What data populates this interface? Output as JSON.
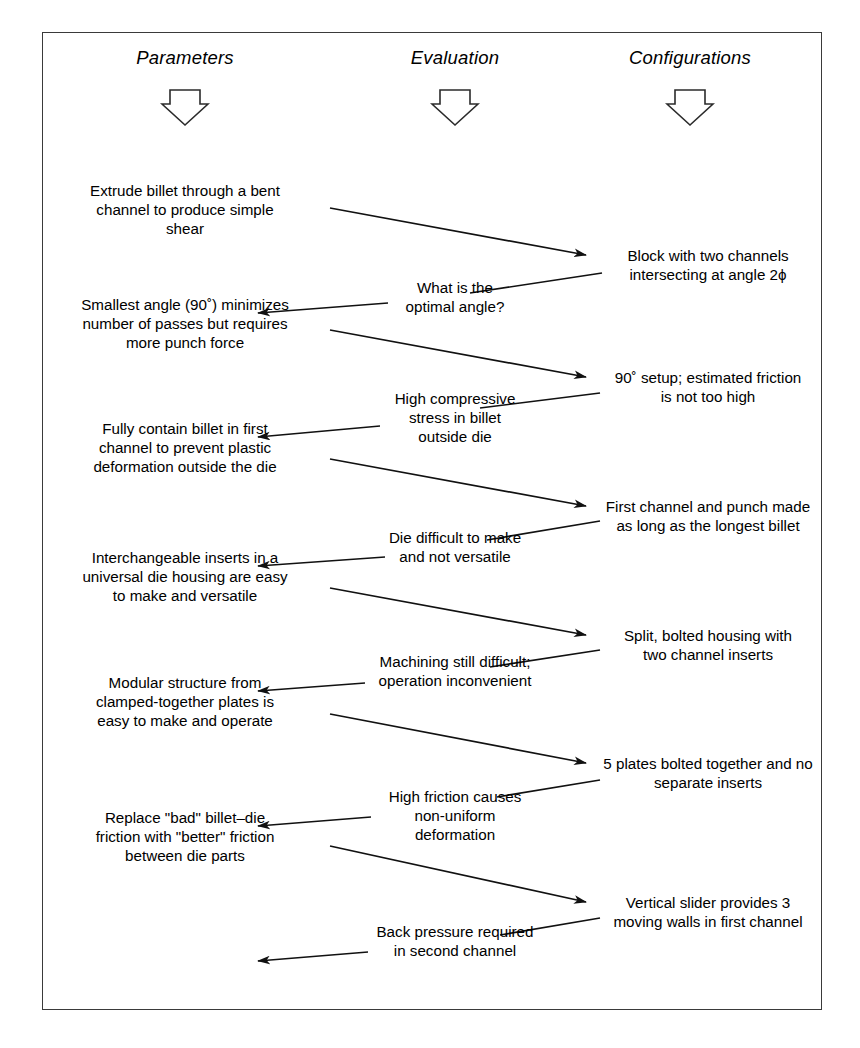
{
  "diagram": {
    "frame": {
      "border_color": "#3a3a3a",
      "background": "#ffffff"
    },
    "columns": [
      {
        "id": "parameters",
        "label": "Parameters",
        "arrow_icon": "block-down-arrow-icon"
      },
      {
        "id": "evaluation",
        "label": "Evaluation",
        "arrow_icon": "block-down-arrow-icon"
      },
      {
        "id": "configurations",
        "label": "Configurations",
        "arrow_icon": "block-down-arrow-icon"
      }
    ],
    "parameters": [
      {
        "id": "p1",
        "text": "Extrude billet through a bent\nchannel to produce simple\nshear"
      },
      {
        "id": "p2",
        "text": "Smallest angle (90˚) minimizes\nnumber of passes but requires\nmore punch force"
      },
      {
        "id": "p3",
        "text": "Fully contain billet in first\nchannel to prevent plastic\ndeformation outside the die"
      },
      {
        "id": "p4",
        "text": "Interchangeable inserts in a\nuniversal die housing are easy\nto make and versatile"
      },
      {
        "id": "p5",
        "text": "Modular structure from\nclamped-together plates is\neasy to make and operate"
      },
      {
        "id": "p6",
        "text": "Replace \"bad\"  billet–die\nfriction with \"better\" friction\nbetween die parts"
      }
    ],
    "evaluations": [
      {
        "id": "e1",
        "text": "What is the\noptimal angle?"
      },
      {
        "id": "e2",
        "text": "High compressive\nstress in billet\noutside die"
      },
      {
        "id": "e3",
        "text": "Die difficult to make\nand not versatile"
      },
      {
        "id": "e4",
        "text": "Machining still difficult;\noperation inconvenient"
      },
      {
        "id": "e5",
        "text": "High friction causes\nnon-uniform\ndeformation"
      },
      {
        "id": "e6",
        "text": "Back pressure required\nin second channel"
      }
    ],
    "configurations": [
      {
        "id": "c1",
        "text": "Block with two channels\nintersecting at angle 2ϕ"
      },
      {
        "id": "c2",
        "text": "90˚ setup; estimated friction\nis not too high"
      },
      {
        "id": "c3",
        "text": "First channel and punch made\nas long as the longest billet"
      },
      {
        "id": "c4",
        "text": "Split, bolted housing with\ntwo channel inserts"
      },
      {
        "id": "c5",
        "text": "5 plates bolted together and no\nseparate inserts"
      },
      {
        "id": "c6",
        "text": "Vertical slider provides 3\nmoving walls in first channel"
      }
    ],
    "connectors": [
      {
        "id": "a1",
        "from": "p1",
        "to": "c1",
        "direction": "right"
      },
      {
        "id": "a2",
        "from": "c1",
        "to": "p2",
        "direction": "left"
      },
      {
        "id": "a3",
        "from": "p2",
        "to": "c2",
        "direction": "right"
      },
      {
        "id": "a4",
        "from": "c2",
        "to": "p3",
        "direction": "left"
      },
      {
        "id": "a5",
        "from": "p3",
        "to": "c3",
        "direction": "right"
      },
      {
        "id": "a6",
        "from": "c3",
        "to": "p4",
        "direction": "left"
      },
      {
        "id": "a7",
        "from": "p4",
        "to": "c4",
        "direction": "right"
      },
      {
        "id": "a8",
        "from": "c4",
        "to": "p5",
        "direction": "left"
      },
      {
        "id": "a9",
        "from": "p5",
        "to": "c5",
        "direction": "right"
      },
      {
        "id": "a10",
        "from": "c5",
        "to": "p6",
        "direction": "left"
      },
      {
        "id": "a11",
        "from": "p6",
        "to": "c6",
        "direction": "right"
      },
      {
        "id": "a12",
        "from": "c6",
        "to": "end",
        "direction": "left"
      }
    ]
  }
}
